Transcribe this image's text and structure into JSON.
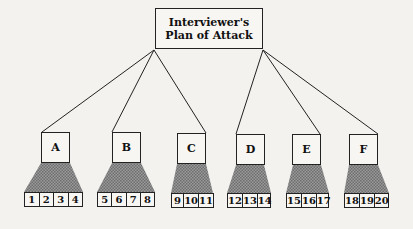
{
  "root": {
    "line1": "Interviewer's",
    "line2": "Plan of Attack"
  },
  "nodes": [
    {
      "label": "A",
      "items": [
        "1",
        "2",
        "3",
        "4"
      ]
    },
    {
      "label": "B",
      "items": [
        "5",
        "6",
        "7",
        "8"
      ]
    },
    {
      "label": "C",
      "items": [
        "9",
        "10",
        "11"
      ]
    },
    {
      "label": "D",
      "items": [
        "12",
        "13",
        "14"
      ]
    },
    {
      "label": "E",
      "items": [
        "15",
        "16",
        "17"
      ]
    },
    {
      "label": "F",
      "items": [
        "18",
        "19",
        "20"
      ]
    }
  ],
  "colors": {
    "background": "#f3f2ef",
    "line": "#222222",
    "shading": "#8a8a8a"
  }
}
